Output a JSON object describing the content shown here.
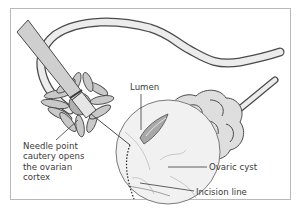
{
  "figure": {
    "style": "grayscale line art",
    "colors": {
      "line": "#4a4a4a",
      "fill_light": "#ececec",
      "fill_mid": "#d6d6d6",
      "fill_dark": "#a8a8a8",
      "frame": "#b9b9b9",
      "text": "#3a3a3a"
    }
  },
  "labels": {
    "lumen": "Lumen",
    "needle_lines": [
      "Needle point",
      "cautery opens",
      "the ovarian",
      "cortex"
    ],
    "ovarian_cyst": "Ovaric cyst",
    "incision_line": "Incision line"
  }
}
